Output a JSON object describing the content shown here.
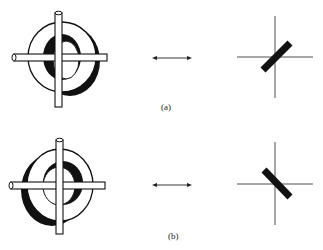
{
  "figure": {
    "panels": [
      {
        "label": "(a)",
        "object": "ring-with-crossed-rods",
        "dark_side": "right",
        "arrow": "double-headed-horizontal",
        "bar_orientation": "tilted-up-right (+45 degrees)"
      },
      {
        "label": "(b)",
        "object": "ring-with-crossed-rods",
        "dark_side": "left",
        "arrow": "double-headed-horizontal",
        "bar_orientation": "tilted-down-right (-45 degrees)"
      }
    ],
    "colors": {
      "ink": "#111111",
      "background": "#ffffff"
    }
  }
}
